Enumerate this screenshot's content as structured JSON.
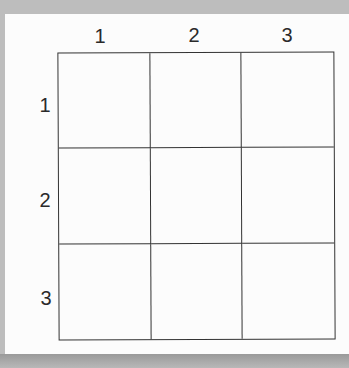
{
  "grid": {
    "rows": 3,
    "columns": 3,
    "column_labels": [
      "1",
      "2",
      "3"
    ],
    "row_labels": [
      "1",
      "2",
      "3"
    ],
    "cells": [
      [
        "",
        "",
        ""
      ],
      [
        "",
        "",
        ""
      ],
      [
        "",
        "",
        ""
      ]
    ],
    "line_color": "#333333"
  }
}
